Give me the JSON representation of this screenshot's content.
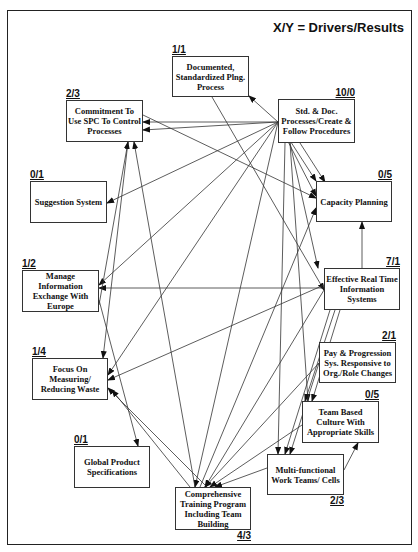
{
  "legend": "X/Y = Drivers/Results",
  "colors": {
    "line": "#333333",
    "border": "#222222",
    "background": "#ffffff"
  },
  "nodes": [
    {
      "id": "documented",
      "label": "Documented, Standardized Plng. Process",
      "score": "1/1",
      "x": 172,
      "y": 56,
      "w": 77,
      "h": 41,
      "score_pos": "tl"
    },
    {
      "id": "commitment",
      "label": "Commitment To Use SPC To Control Processes",
      "score": "2/3",
      "x": 66,
      "y": 100,
      "w": 77,
      "h": 42,
      "score_pos": "tl"
    },
    {
      "id": "std_doc",
      "label": "Std. & Doc. Processes/Create & Follow Procedures",
      "score": "10/0",
      "x": 278,
      "y": 99,
      "w": 77,
      "h": 44,
      "score_pos": "tr"
    },
    {
      "id": "suggestion",
      "label": "Suggestion System",
      "score": "0/1",
      "x": 30,
      "y": 181,
      "w": 77,
      "h": 42,
      "score_pos": "tl"
    },
    {
      "id": "capacity",
      "label": "Capacity Planning",
      "score": "0/5",
      "x": 316,
      "y": 181,
      "w": 76,
      "h": 41,
      "score_pos": "tr"
    },
    {
      "id": "manage",
      "label": "Manage Information Exchange With Europe",
      "score": "1/2",
      "x": 22,
      "y": 270,
      "w": 77,
      "h": 42,
      "score_pos": "tl"
    },
    {
      "id": "effective",
      "label": "Effective Real Time Information Systems",
      "score": "7/1",
      "x": 324,
      "y": 268,
      "w": 76,
      "h": 42,
      "score_pos": "tr"
    },
    {
      "id": "pay",
      "label": "Pay & Progression Sys. Responsive to Org./Role Changes",
      "score": "2/1",
      "x": 319,
      "y": 342,
      "w": 77,
      "h": 41,
      "score_pos": "tr"
    },
    {
      "id": "focus",
      "label": "Focus On Measuring/ Reducing Waste",
      "score": "1/4",
      "x": 32,
      "y": 358,
      "w": 76,
      "h": 42,
      "score_pos": "tl"
    },
    {
      "id": "team_based",
      "label": "Team Based Culture With Appropriate Skills",
      "score": "0/5",
      "x": 302,
      "y": 401,
      "w": 77,
      "h": 42,
      "score_pos": "tr"
    },
    {
      "id": "global",
      "label": "Global Product Specifications",
      "score": "0/1",
      "x": 74,
      "y": 446,
      "w": 76,
      "h": 42,
      "score_pos": "tl"
    },
    {
      "id": "multi",
      "label": "Multi-functional Work Teams/ Cells",
      "score": "2/3",
      "x": 267,
      "y": 454,
      "w": 77,
      "h": 41,
      "score_pos": "br"
    },
    {
      "id": "comprehensive",
      "label": "Comprehensive Training Program Including Team Building",
      "score": "4/3",
      "x": 175,
      "y": 487,
      "w": 76,
      "h": 43,
      "score_pos": "br"
    }
  ],
  "edges": [
    {
      "from": [
        278,
        122
      ],
      "to": [
        249,
        96
      ]
    },
    {
      "from": [
        278,
        122
      ],
      "to": [
        143,
        122
      ]
    },
    {
      "from": [
        278,
        122
      ],
      "to": [
        143,
        130
      ]
    },
    {
      "from": [
        278,
        122
      ],
      "to": [
        107,
        203
      ]
    },
    {
      "from": [
        278,
        122
      ],
      "to": [
        99,
        285
      ]
    },
    {
      "from": [
        278,
        122
      ],
      "to": [
        108,
        375
      ]
    },
    {
      "from": [
        278,
        122
      ],
      "to": [
        195,
        487
      ]
    },
    {
      "from": [
        278,
        122
      ],
      "to": [
        316,
        181
      ]
    },
    {
      "from": [
        278,
        122
      ],
      "to": [
        316,
        196
      ]
    },
    {
      "from": [
        300,
        143
      ],
      "to": [
        325,
        182
      ]
    },
    {
      "from": [
        290,
        143
      ],
      "to": [
        318,
        268
      ]
    },
    {
      "from": [
        285,
        143
      ],
      "to": [
        278,
        454
      ]
    },
    {
      "from": [
        290,
        143
      ],
      "to": [
        308,
        401
      ]
    },
    {
      "from": [
        212,
        97
      ],
      "to": [
        324,
        290
      ]
    },
    {
      "from": [
        143,
        115
      ],
      "to": [
        316,
        198
      ]
    },
    {
      "from": [
        128,
        142
      ],
      "to": [
        103,
        358
      ]
    },
    {
      "from": [
        195,
        487
      ],
      "to": [
        134,
        142
      ]
    },
    {
      "from": [
        362,
        268
      ],
      "to": [
        362,
        222
      ]
    },
    {
      "from": [
        324,
        288
      ],
      "to": [
        99,
        288
      ]
    },
    {
      "from": [
        324,
        285
      ],
      "to": [
        108,
        380
      ]
    },
    {
      "from": [
        324,
        290
      ],
      "to": [
        205,
        487
      ]
    },
    {
      "from": [
        330,
        310
      ],
      "to": [
        285,
        454
      ]
    },
    {
      "from": [
        335,
        310
      ],
      "to": [
        305,
        401
      ]
    },
    {
      "from": [
        340,
        310
      ],
      "to": [
        312,
        401
      ]
    },
    {
      "from": [
        200,
        487
      ],
      "to": [
        316,
        208
      ]
    },
    {
      "from": [
        99,
        300
      ],
      "to": [
        138,
        446
      ]
    },
    {
      "from": [
        207,
        487
      ],
      "to": [
        108,
        388
      ]
    },
    {
      "from": [
        319,
        363
      ],
      "to": [
        205,
        487
      ]
    },
    {
      "from": [
        319,
        363
      ],
      "to": [
        290,
        454
      ]
    },
    {
      "from": [
        302,
        425
      ],
      "to": [
        210,
        487
      ]
    },
    {
      "from": [
        267,
        468
      ],
      "to": [
        215,
        487
      ]
    },
    {
      "from": [
        344,
        470
      ],
      "to": [
        358,
        443
      ]
    },
    {
      "from": [
        99,
        305
      ],
      "to": [
        128,
        142
      ]
    },
    {
      "from": [
        190,
        487
      ],
      "to": [
        112,
        390
      ]
    }
  ]
}
